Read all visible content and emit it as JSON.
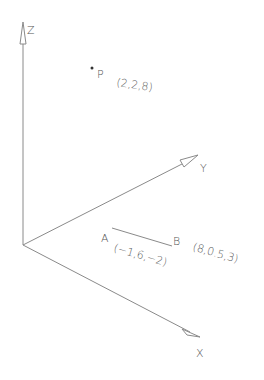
{
  "diagram": {
    "type": "3d-coordinate-axes",
    "axes": {
      "x": {
        "label": "X"
      },
      "y": {
        "label": "Y"
      },
      "z": {
        "label": "Z"
      }
    },
    "point_p": {
      "label": "P",
      "coords": "(2,2,8)"
    },
    "segment_ab": {
      "point_a": {
        "label": "A",
        "coords": "(−1,6,−2)"
      },
      "point_b": {
        "label": "B",
        "coords": "(8,0.5,3)"
      }
    },
    "colors": {
      "line": "#8a8a8a",
      "text": "#555555",
      "background": "#ffffff"
    }
  }
}
